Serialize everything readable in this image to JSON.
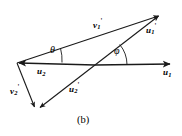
{
  "figure": {
    "caption": "(b)",
    "canvas": {
      "width": 182,
      "height": 136,
      "background": "#ffffff"
    },
    "origin": {
      "x": 95,
      "y": 65
    },
    "left_vertex": {
      "x": 17,
      "y": 63
    },
    "bottom_vertex": {
      "x": 37,
      "y": 110
    },
    "stroke_color": "#1a1a1a",
    "vectors": [
      {
        "id": "u1",
        "label_base": "u",
        "label_sub": "1",
        "label_prime": "",
        "from": {
          "x": 95,
          "y": 65
        },
        "to": {
          "x": 173,
          "y": 64
        },
        "description": "horizontal reference vector pointing right"
      },
      {
        "id": "u2",
        "label_base": "u",
        "label_sub": "2",
        "label_prime": "",
        "from": {
          "x": 95,
          "y": 65
        },
        "to": {
          "x": 16,
          "y": 63
        },
        "description": "horizontal reference vector pointing left"
      },
      {
        "id": "u1p",
        "label_base": "u",
        "label_sub": "1",
        "label_prime": "'",
        "from": {
          "x": 95,
          "y": 65
        },
        "to": {
          "x": 161,
          "y": 14
        },
        "description": "rotated vector u1 prime, up and to the right"
      },
      {
        "id": "u2p",
        "label_base": "u",
        "label_sub": "2",
        "label_prime": "'",
        "from": {
          "x": 95,
          "y": 65
        },
        "to": {
          "x": 38,
          "y": 110
        },
        "description": "rotated vector u2 prime, down and to the left"
      },
      {
        "id": "v1p",
        "label_base": "v",
        "label_sub": "1",
        "label_prime": "'",
        "from": {
          "x": 17,
          "y": 63
        },
        "to": {
          "x": 161,
          "y": 14
        },
        "description": "difference vector v1 prime from left vertex to u1 prime tip"
      },
      {
        "id": "v2p",
        "label_base": "v",
        "label_sub": "2",
        "label_prime": "'",
        "from": {
          "x": 17,
          "y": 63
        },
        "to": {
          "x": 36,
          "y": 110
        },
        "description": "difference vector v2 prime from left vertex down to u2 prime tip"
      }
    ],
    "angles": [
      {
        "id": "theta",
        "symbol": "θ",
        "vertex": {
          "x": 17,
          "y": 63
        },
        "description": "angle between u2 axis and v1 prime at the left vertex"
      },
      {
        "id": "phi",
        "symbol": "φ",
        "vertex": {
          "x": 95,
          "y": 65
        },
        "description": "angle between u1 axis and u1 prime at the origin"
      }
    ]
  }
}
